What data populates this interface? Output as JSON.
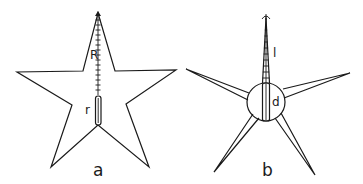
{
  "figure": {
    "panels": [
      {
        "id": "a",
        "caption": "a",
        "shape": "five-pointed star",
        "labels": {
          "outer_radius": "R",
          "inner_radius": "r"
        }
      },
      {
        "id": "b",
        "caption": "b",
        "shape": "central disc with five slender arms",
        "labels": {
          "arm_length": "l",
          "disc_diameter": "d"
        }
      }
    ],
    "colors": {
      "line": "#1a1a1a",
      "background": "#ffffff"
    }
  }
}
